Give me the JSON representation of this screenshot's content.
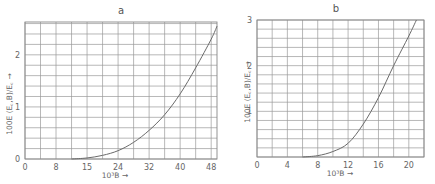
{
  "chart_data": [
    {
      "type": "line",
      "title": "a",
      "xlabel": "10^3 B →",
      "ylabel": "100E (E_c,B)/E_c →",
      "xlim": [
        0,
        49.5
      ],
      "ylim": [
        0,
        2.63
      ],
      "x_ticks": [
        0,
        8,
        16,
        24,
        32,
        40,
        48
      ],
      "x_tick_labels": [
        "0",
        "8",
        "15",
        "24",
        "32",
        "40",
        "48"
      ],
      "y_ticks": [
        0,
        1,
        2
      ],
      "y_tick_labels": [
        "0",
        "1",
        "2"
      ],
      "grid": true,
      "x_grid_step": 4,
      "y_grid_step": 0.2,
      "series": [
        {
          "name": "a",
          "x": [
            12,
            16,
            20,
            24,
            28,
            32,
            36,
            40,
            44,
            48,
            49.5
          ],
          "y": [
            0,
            0.02,
            0.07,
            0.16,
            0.32,
            0.55,
            0.85,
            1.25,
            1.75,
            2.3,
            2.55
          ]
        }
      ]
    },
    {
      "type": "line",
      "title": "b",
      "xlabel": "10^3 B →",
      "ylabel": "100E (E_c,B)/E_c →",
      "xlim": [
        0,
        22
      ],
      "ylim": [
        0,
        3
      ],
      "x_ticks": [
        0,
        4,
        8,
        12,
        16,
        20
      ],
      "x_tick_labels": [
        "0",
        "4",
        "8",
        "12",
        "16",
        "20"
      ],
      "y_ticks": [
        1,
        2,
        3
      ],
      "y_tick_labels": [
        "1",
        "2",
        "3"
      ],
      "grid": true,
      "x_grid_step": 2,
      "y_grid_step": 0.2,
      "series": [
        {
          "name": "b",
          "x": [
            6,
            8,
            10,
            12,
            14,
            16,
            18,
            20,
            21
          ],
          "y": [
            0,
            0.03,
            0.12,
            0.3,
            0.72,
            1.3,
            2.0,
            2.65,
            3.0
          ]
        }
      ]
    }
  ],
  "panels": {
    "a": {
      "title": "a",
      "xlabel": "10³B →",
      "ylabel": "100E (E꜀,B)/E꜀ →"
    },
    "b": {
      "title": "b",
      "xlabel": "10³B →",
      "ylabel": "100E (E꜀,B)/E꜀ →"
    }
  }
}
